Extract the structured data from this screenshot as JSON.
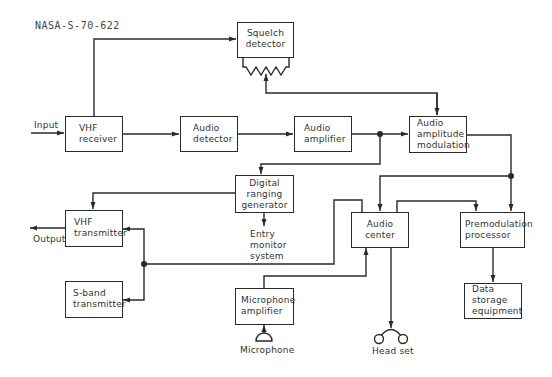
{
  "figure_id": "NASA-S-70-622",
  "blocks": {
    "squelch_detector": [
      "Squelch",
      "detector"
    ],
    "vhf_receiver": [
      "VHF",
      "receiver"
    ],
    "audio_detector": [
      "Audio",
      "detector"
    ],
    "audio_amplifier": [
      "Audio",
      "amplifier"
    ],
    "audio_amplitude_modulation": [
      "Audio",
      "amplitude",
      "modulation"
    ],
    "digital_ranging_generator": [
      "Digital",
      "ranging",
      "generator"
    ],
    "vhf_transmitter": [
      "VHF",
      "transmitter"
    ],
    "s_band_transmitter": [
      "S-band",
      "transmitter"
    ],
    "audio_center": [
      "Audio",
      "center"
    ],
    "premodulation_processor": [
      "Premodulation",
      "processor"
    ],
    "microphone_amplifier": [
      "Microphone",
      "amplifier"
    ],
    "data_storage_equipment": [
      "Data",
      "storage",
      "equipment"
    ]
  },
  "labels": {
    "input": "Input",
    "output": "Output",
    "entry_monitor_system": [
      "Entry",
      "monitor",
      "system"
    ],
    "microphone": "Microphone",
    "headset": "Head set"
  },
  "colors": {
    "line": "#2a2a2a",
    "text": "#333333",
    "background": "#ffffff"
  }
}
